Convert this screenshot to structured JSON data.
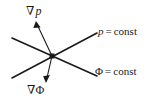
{
  "figure": {
    "type": "vector-diagram",
    "width": 157,
    "height": 110,
    "background_color": "#ffffff",
    "stroke_color": "#1a1a1a",
    "text_color": "#1a1a1a"
  },
  "labels": {
    "grad_p": {
      "nabla": "∇",
      "symbol": "p"
    },
    "grad_phi": {
      "nabla": "∇",
      "symbol": "Φ"
    },
    "p_const": {
      "symbol": "p",
      "equals": "=",
      "value": "const"
    },
    "phi_const": {
      "symbol": "Φ",
      "equals": "=",
      "value": "const"
    }
  },
  "geometry": {
    "origin": {
      "x": 52,
      "y": 56,
      "marker": "square-dot",
      "size": 5
    },
    "lines": [
      {
        "name": "p-const-line",
        "from": {
          "x": 12,
          "y": 78
        },
        "to": {
          "x": 97,
          "y": 33
        },
        "width": 1.6
      },
      {
        "name": "phi-const-line",
        "from": {
          "x": 12,
          "y": 38
        },
        "to": {
          "x": 97,
          "y": 76
        },
        "width": 1.6
      }
    ],
    "arrows": [
      {
        "name": "grad-p-arrow",
        "from": {
          "x": 52,
          "y": 56
        },
        "to": {
          "x": 36,
          "y": 22
        },
        "width": 1.1,
        "head": "solid-triangle"
      },
      {
        "name": "grad-phi-arrow",
        "from": {
          "x": 52,
          "y": 56
        },
        "to": {
          "x": 46,
          "y": 82
        },
        "width": 1.1,
        "head": "solid-triangle"
      }
    ]
  }
}
